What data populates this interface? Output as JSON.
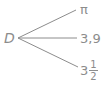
{
  "diagram": {
    "origin_label": "D",
    "branches": [
      {
        "label": "π"
      },
      {
        "label": "3,9"
      },
      {
        "label_whole": "3",
        "label_numerator": "1",
        "label_denominator": "2"
      }
    ],
    "line_color": "#8c8c8c",
    "text_color": "#8c8c8c"
  }
}
